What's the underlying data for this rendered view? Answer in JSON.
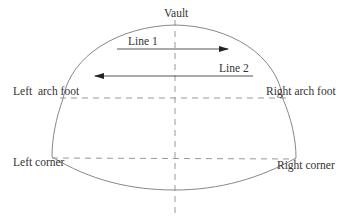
{
  "diagram": {
    "type": "tunnel-cross-section",
    "labels": {
      "vault": "Vault",
      "line1": "Line 1",
      "line2": "Line 2",
      "left_arch_foot": "Left  arch foot",
      "right_arch_foot": "Right arch foot",
      "left_corner": "Left corner",
      "right_corner": "Right corner"
    },
    "arrows": [
      {
        "name": "Line 1",
        "direction": "left-to-right"
      },
      {
        "name": "Line 2",
        "direction": "right-to-left"
      }
    ],
    "colors": {
      "outline": "#888888",
      "dashed": "#999999",
      "arrow": "#555555",
      "text": "#333333"
    }
  }
}
